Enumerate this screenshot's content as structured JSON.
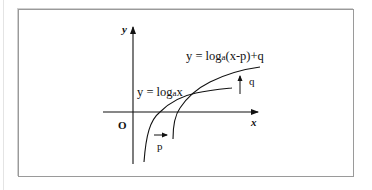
{
  "diagram": {
    "type": "function-graph",
    "axes": {
      "x_label": "x",
      "y_label": "y",
      "origin_label": "O"
    },
    "curves": [
      {
        "name": "base-curve",
        "label": "y = logₐx",
        "label_parts": {
          "pre": "y = log",
          "sub": "a",
          "post": "x"
        }
      },
      {
        "name": "shifted-curve",
        "label": "y = logₐ(x-p)+q",
        "label_parts": {
          "pre": "y = log",
          "sub": "a",
          "post": "(x-p)+q"
        }
      }
    ],
    "shifts": {
      "horizontal": {
        "label": "p",
        "direction": "right"
      },
      "vertical": {
        "label": "q",
        "direction": "up"
      }
    }
  }
}
